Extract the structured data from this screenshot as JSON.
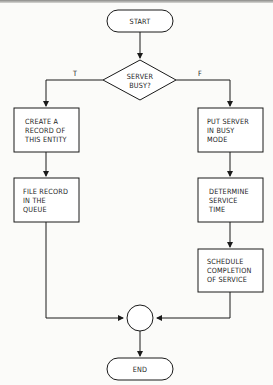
{
  "diagram": {
    "type": "flowchart",
    "nodes": {
      "start": {
        "shape": "terminator",
        "label": "START"
      },
      "decision": {
        "shape": "diamond",
        "label": "SERVER\nBUSY?"
      },
      "create_record": {
        "shape": "process",
        "label": "CREATE A\nRECORD OF\nTHIS ENTITY"
      },
      "file_record": {
        "shape": "process",
        "label": "FILE RECORD\nIN THE\nQUEUE"
      },
      "put_server_busy": {
        "shape": "process",
        "label": "PUT SERVER\nIN BUSY\nMODE"
      },
      "determine_time": {
        "shape": "process",
        "label": "DETERMINE\nSERVICE\nTIME"
      },
      "schedule_completion": {
        "shape": "process",
        "label": "SCHEDULE\nCOMPLETION\nOF SERVICE"
      },
      "connector": {
        "shape": "circle",
        "label": ""
      },
      "end": {
        "shape": "terminator",
        "label": "END"
      }
    },
    "edge_labels": {
      "true_branch": "T",
      "false_branch": "F"
    },
    "edges": [
      [
        "start",
        "decision"
      ],
      [
        "decision",
        "create_record",
        "T"
      ],
      [
        "decision",
        "put_server_busy",
        "F"
      ],
      [
        "create_record",
        "file_record"
      ],
      [
        "put_server_busy",
        "determine_time"
      ],
      [
        "determine_time",
        "schedule_completion"
      ],
      [
        "file_record",
        "connector"
      ],
      [
        "schedule_completion",
        "connector"
      ],
      [
        "connector",
        "end"
      ]
    ]
  }
}
